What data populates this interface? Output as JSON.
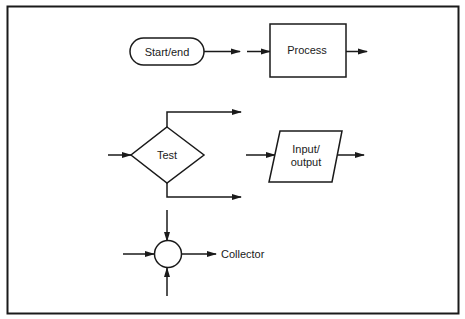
{
  "diagram": {
    "colors": {
      "stroke": "#1a1a1a",
      "background": "#ffffff"
    },
    "symbols": [
      {
        "id": "start-end",
        "shape": "terminal",
        "label": "Start/end"
      },
      {
        "id": "process",
        "shape": "rectangle",
        "label": "Process"
      },
      {
        "id": "test",
        "shape": "diamond",
        "label": "Test"
      },
      {
        "id": "input-output",
        "shape": "parallelogram",
        "label_line1": "Input/",
        "label_line2": "output"
      },
      {
        "id": "collector",
        "shape": "circle",
        "label": "Collector"
      }
    ]
  }
}
